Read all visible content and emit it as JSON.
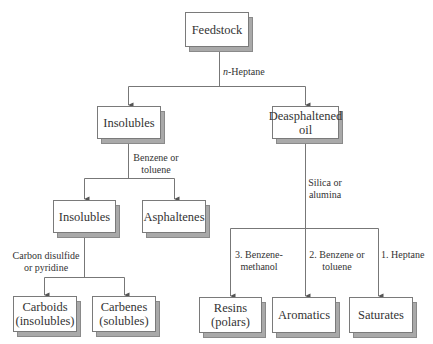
{
  "diagram": {
    "type": "flowchart",
    "nodes": {
      "feedstock": "Feedstock",
      "insolubles_1": "Insolubles",
      "deasphaltened_oil": "Deasphaltened\noil",
      "insolubles_2": "Insolubles",
      "asphaltenes": "Asphaltenes",
      "carboids": "Carboids\n(insolubles)",
      "carbenes": "Carbenes\n(solubles)",
      "resins": "Resins\n(polars)",
      "aromatics": "Aromatics",
      "saturates": "Saturates"
    },
    "edge_labels": {
      "n_heptane_prefix": "n",
      "n_heptane_suffix": "-Heptane",
      "benzene_or_toluene": "Benzene or\ntoluene",
      "silica_or_alumina": "Silica or\nalumina",
      "carbon_disulfide": "Carbon disulfide\nor pyridine",
      "benzene_methanol": "3. Benzene-\nmethanol",
      "benzene_toluene_2": "2. Benzene or\ntoluene",
      "heptane_1": "1. Heptane"
    },
    "edges": [
      {
        "from": "Feedstock",
        "to": "Insolubles",
        "label": "n-Heptane"
      },
      {
        "from": "Feedstock",
        "to": "Deasphaltened oil",
        "label": "n-Heptane"
      },
      {
        "from": "Insolubles",
        "to": "Insolubles (2)",
        "label": "Benzene or toluene"
      },
      {
        "from": "Insolubles",
        "to": "Asphaltenes",
        "label": "Benzene or toluene"
      },
      {
        "from": "Insolubles (2)",
        "to": "Carboids (insolubles)",
        "label": "Carbon disulfide or pyridine"
      },
      {
        "from": "Insolubles (2)",
        "to": "Carbenes (solubles)",
        "label": "Carbon disulfide or pyridine"
      },
      {
        "from": "Deasphaltened oil",
        "to": "Resins (polars)",
        "label": "3. Benzene-methanol"
      },
      {
        "from": "Deasphaltened oil",
        "to": "Aromatics",
        "label": "2. Benzene or toluene"
      },
      {
        "from": "Deasphaltened oil",
        "to": "Saturates",
        "label": "1. Heptane"
      }
    ],
    "colors": {
      "line": "#777777",
      "box_border": "#7a7a7a",
      "shadow": "#a9a9a9",
      "text": "#333333"
    }
  }
}
